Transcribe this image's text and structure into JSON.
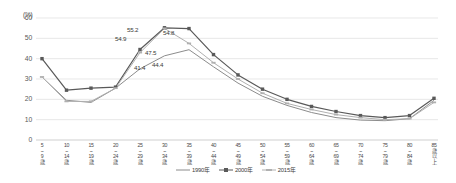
{
  "chart_data": {
    "type": "line",
    "title": "",
    "subtitle": "",
    "xlabel": "",
    "ylabel": "",
    "unit_label": "(%)",
    "ylim": [
      0,
      60
    ],
    "ytick_step": 10,
    "yticks": [
      "60",
      "50",
      "40",
      "30",
      "20",
      "10",
      "0"
    ],
    "grid": true,
    "legend_position": "bottom-center",
    "categories": [
      "5\n~\n9\n歳",
      "10\n~\n14\n歳",
      "15\n~\n19\n歳",
      "20\n~\n24\n歳",
      "25\n~\n29\n歳",
      "30\n~\n34\n歳",
      "35\n~\n39\n歳",
      "40\n~\n44\n歳",
      "45\n~\n49\n歳",
      "50\n~\n54\n歳",
      "55\n~\n59\n歳",
      "60\n~\n64\n歳",
      "65\n~\n69\n歳",
      "70\n~\n74\n歳",
      "75\n~\n79\n歳",
      "80\n~\n84\n歳",
      "85\n歳\n以\n上"
    ],
    "series": [
      {
        "name": "1990年",
        "color": "#8c8c8c",
        "marker": "none",
        "values": [
          31.0,
          19.5,
          18.5,
          25.5,
          35.0,
          41.4,
          44.4,
          36.0,
          28.0,
          21.5,
          17.0,
          13.5,
          11.0,
          9.8,
          9.5,
          10.5,
          19.5
        ]
      },
      {
        "name": "2000年",
        "color": "#595959",
        "marker": "square",
        "values": [
          40.0,
          24.5,
          25.5,
          26.0,
          44.5,
          55.2,
          54.8,
          42.0,
          32.0,
          25.0,
          20.0,
          16.5,
          14.0,
          12.0,
          11.0,
          12.0,
          20.5
        ]
      },
      {
        "name": "2015年",
        "color": "#b0b0b0",
        "marker": "dash",
        "values": [
          31.0,
          19.0,
          19.0,
          25.5,
          43.0,
          54.9,
          47.5,
          38.0,
          30.0,
          23.0,
          18.0,
          15.0,
          12.5,
          11.0,
          10.0,
          10.5,
          18.5
        ]
      }
    ],
    "point_labels": [
      {
        "text": "54.9",
        "series": "2015年",
        "category_index": 5,
        "x": 115,
        "y": 35
      },
      {
        "text": "55.2",
        "series": "2000年",
        "category_index": 5,
        "x": 127,
        "y": 26
      },
      {
        "text": "54.8",
        "series": "2000年",
        "category_index": 6,
        "x": 163,
        "y": 29
      },
      {
        "text": "47.5",
        "series": "2015年",
        "category_index": 6,
        "x": 145,
        "y": 49
      },
      {
        "text": "41.4",
        "series": "1990年",
        "category_index": 5,
        "x": 134,
        "y": 64
      },
      {
        "text": "44.4",
        "series": "1990年",
        "category_index": 6,
        "x": 152,
        "y": 61
      }
    ]
  },
  "legend": {
    "items": [
      {
        "label": "1990年",
        "color": "#8c8c8c",
        "marker": "line"
      },
      {
        "label": "2000年",
        "color": "#595959",
        "marker": "square"
      },
      {
        "label": "2015年",
        "color": "#b0b0b0",
        "marker": "dash"
      }
    ]
  }
}
